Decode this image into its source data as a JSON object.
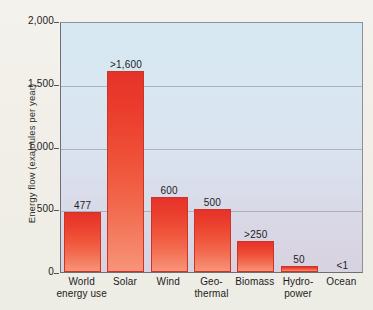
{
  "chart_data": {
    "type": "bar",
    "title": "",
    "xlabel": "",
    "ylabel": "Energy flow (exajoules per year)",
    "ylim": [
      0,
      2000
    ],
    "grid": true,
    "legend": "none",
    "ytick_labels": [
      "2,000",
      "1,500",
      "1,000",
      "500",
      "0"
    ],
    "ytick_values": [
      2000,
      1500,
      1000,
      500,
      0
    ],
    "categories": [
      "World energy use",
      "Solar",
      "Wind",
      "Geo-thermal",
      "Biomass",
      "Hydro-power",
      "Ocean"
    ],
    "category_lines": [
      [
        "World",
        "energy use"
      ],
      [
        "Solar",
        ""
      ],
      [
        "Wind",
        ""
      ],
      [
        "Geo-",
        "thermal"
      ],
      [
        "Biomass",
        ""
      ],
      [
        "Hydro-",
        "power"
      ],
      [
        "Ocean",
        ""
      ]
    ],
    "values": [
      477,
      1600,
      600,
      500,
      250,
      50,
      1
    ],
    "data_labels": [
      "477",
      ">1,600",
      "600",
      "500",
      ">250",
      "50",
      "<1"
    ],
    "bar_color": "#e8352a",
    "bar_color_bottom": "#f79479",
    "plot_bg_top": "#d6e8f3",
    "plot_bg_bottom": "#d8d2e0",
    "page_bg": "#f3f1ea",
    "axis_color": "#6d6f74",
    "gridline_color": "#9ba3ae"
  }
}
